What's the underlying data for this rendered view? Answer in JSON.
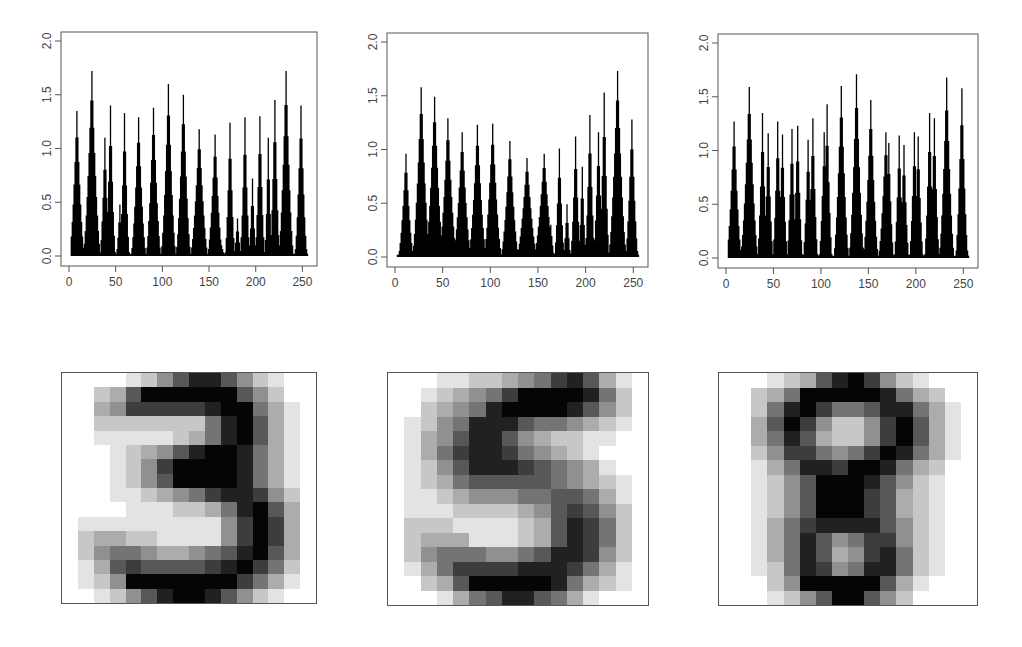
{
  "chart_data": [
    {
      "type": "bar",
      "title": "",
      "xlabel": "",
      "ylabel": "",
      "xlim": [
        0,
        256
      ],
      "ylim": [
        0,
        2.0
      ],
      "x_ticks": [
        0,
        50,
        100,
        150,
        200,
        250
      ],
      "y_ticks": [
        "0.0",
        "0.5",
        "1.0",
        "1.5",
        "2.0"
      ],
      "grid": false,
      "legend": null,
      "note": "256 spike-profile values; peaks listed as [x, height, halfwidth]",
      "peaks": [
        [
          8,
          1.35,
          6
        ],
        [
          24,
          1.72,
          7
        ],
        [
          38,
          1.1,
          4
        ],
        [
          44,
          1.4,
          4
        ],
        [
          54,
          0.48,
          3
        ],
        [
          59,
          1.33,
          4
        ],
        [
          74,
          1.29,
          6
        ],
        [
          90,
          1.38,
          6
        ],
        [
          106,
          1.6,
          6
        ],
        [
          122,
          1.5,
          6
        ],
        [
          139,
          1.18,
          7
        ],
        [
          156,
          1.13,
          6
        ],
        [
          163,
          0.1,
          3
        ],
        [
          172,
          1.24,
          4
        ],
        [
          180,
          0.35,
          3
        ],
        [
          188,
          1.29,
          4
        ],
        [
          196,
          0.72,
          3
        ],
        [
          204,
          1.3,
          4
        ],
        [
          213,
          1.1,
          3
        ],
        [
          220,
          1.45,
          4
        ],
        [
          232,
          1.72,
          6
        ],
        [
          248,
          1.4,
          5
        ]
      ]
    },
    {
      "type": "bar",
      "title": "",
      "xlabel": "",
      "ylabel": "",
      "xlim": [
        0,
        256
      ],
      "ylim": [
        0,
        2.0
      ],
      "x_ticks": [
        0,
        50,
        100,
        150,
        200,
        250
      ],
      "y_ticks": [
        "0.0",
        "0.5",
        "1.0",
        "1.5",
        "2.0"
      ],
      "grid": false,
      "legend": null,
      "note": "256 spike-profile values; peaks listed as [x, height, halfwidth]",
      "peaks": [
        [
          11,
          0.96,
          6
        ],
        [
          27,
          1.58,
          7
        ],
        [
          41,
          1.49,
          7
        ],
        [
          55,
          1.29,
          7
        ],
        [
          70,
          1.16,
          7
        ],
        [
          86,
          1.23,
          7
        ],
        [
          102,
          1.24,
          7
        ],
        [
          120,
          1.08,
          7
        ],
        [
          138,
          0.92,
          8
        ],
        [
          156,
          0.96,
          8
        ],
        [
          163,
          0.3,
          3
        ],
        [
          172,
          1.01,
          4
        ],
        [
          180,
          0.49,
          3
        ],
        [
          189,
          1.12,
          4
        ],
        [
          196,
          0.84,
          3
        ],
        [
          204,
          1.32,
          4
        ],
        [
          213,
          1.16,
          4
        ],
        [
          219,
          1.53,
          4
        ],
        [
          233,
          1.73,
          7
        ],
        [
          248,
          1.28,
          5
        ]
      ]
    },
    {
      "type": "bar",
      "title": "",
      "xlabel": "",
      "ylabel": "",
      "xlim": [
        0,
        256
      ],
      "ylim": [
        0,
        2.0
      ],
      "x_ticks": [
        0,
        50,
        100,
        150,
        200,
        250
      ],
      "y_ticks": [
        "0.0",
        "0.5",
        "1.0",
        "1.5",
        "2.0"
      ],
      "grid": false,
      "legend": null,
      "note": "256 spike-profile values; peaks listed as [x, height, halfwidth]",
      "peaks": [
        [
          8,
          1.27,
          6
        ],
        [
          24,
          1.59,
          7
        ],
        [
          38,
          1.35,
          4
        ],
        [
          44,
          1.16,
          4
        ],
        [
          54,
          1.27,
          4
        ],
        [
          59,
          1.15,
          4
        ],
        [
          69,
          1.2,
          4
        ],
        [
          75,
          1.23,
          4
        ],
        [
          86,
          1.1,
          4
        ],
        [
          91,
          1.3,
          4
        ],
        [
          103,
          1.17,
          4
        ],
        [
          106,
          1.43,
          4
        ],
        [
          121,
          1.6,
          6
        ],
        [
          137,
          1.71,
          6
        ],
        [
          152,
          1.47,
          6
        ],
        [
          168,
          1.17,
          6
        ],
        [
          171,
          1.07,
          4
        ],
        [
          182,
          1.14,
          4
        ],
        [
          187,
          1.05,
          4
        ],
        [
          198,
          1.17,
          4
        ],
        [
          202,
          1.13,
          4
        ],
        [
          214,
          1.35,
          4
        ],
        [
          219,
          1.3,
          4
        ],
        [
          232,
          1.68,
          6
        ],
        [
          248,
          1.58,
          5
        ]
      ]
    }
  ],
  "digits": [
    {
      "label": "3",
      "grid": [
        [
          0,
          0,
          0,
          0,
          1,
          2,
          4,
          6,
          8,
          8,
          6,
          4,
          2,
          1,
          0,
          0
        ],
        [
          0,
          0,
          2,
          3,
          6,
          9,
          9,
          9,
          9,
          9,
          9,
          6,
          4,
          2,
          0,
          0
        ],
        [
          0,
          0,
          3,
          4,
          7,
          7,
          7,
          7,
          7,
          8,
          9,
          9,
          5,
          3,
          1,
          0
        ],
        [
          0,
          0,
          2,
          2,
          2,
          2,
          2,
          2,
          2,
          5,
          8,
          9,
          6,
          3,
          1,
          0
        ],
        [
          0,
          0,
          1,
          1,
          1,
          1,
          1,
          2,
          3,
          5,
          8,
          9,
          6,
          3,
          1,
          0
        ],
        [
          0,
          0,
          0,
          1,
          2,
          3,
          4,
          6,
          8,
          9,
          9,
          8,
          5,
          3,
          1,
          0
        ],
        [
          0,
          0,
          0,
          1,
          2,
          4,
          7,
          9,
          9,
          9,
          9,
          8,
          5,
          3,
          1,
          0
        ],
        [
          0,
          0,
          0,
          1,
          2,
          4,
          6,
          9,
          9,
          9,
          9,
          8,
          5,
          3,
          1,
          0
        ],
        [
          0,
          0,
          0,
          1,
          1,
          2,
          3,
          4,
          5,
          7,
          8,
          8,
          7,
          4,
          2,
          0
        ],
        [
          0,
          0,
          0,
          0,
          1,
          1,
          1,
          2,
          2,
          3,
          5,
          8,
          9,
          6,
          3,
          0
        ],
        [
          0,
          1,
          1,
          1,
          1,
          1,
          1,
          1,
          1,
          1,
          4,
          7,
          9,
          7,
          3,
          0
        ],
        [
          0,
          2,
          3,
          3,
          2,
          2,
          1,
          1,
          1,
          1,
          4,
          7,
          9,
          7,
          3,
          0
        ],
        [
          0,
          2,
          4,
          5,
          5,
          4,
          3,
          3,
          4,
          5,
          6,
          8,
          9,
          6,
          3,
          0
        ],
        [
          0,
          1,
          3,
          6,
          7,
          6,
          6,
          6,
          6,
          7,
          8,
          9,
          7,
          5,
          2,
          0
        ],
        [
          0,
          1,
          2,
          4,
          9,
          9,
          9,
          9,
          9,
          9,
          9,
          7,
          5,
          3,
          1,
          0
        ],
        [
          0,
          0,
          1,
          2,
          4,
          6,
          8,
          9,
          9,
          8,
          6,
          4,
          2,
          1,
          0,
          0
        ]
      ]
    },
    {
      "label": "5",
      "grid": [
        [
          0,
          0,
          0,
          1,
          1,
          2,
          2,
          3,
          4,
          5,
          7,
          8,
          6,
          3,
          1,
          0
        ],
        [
          0,
          0,
          1,
          2,
          3,
          4,
          5,
          7,
          9,
          9,
          9,
          9,
          8,
          5,
          2,
          0
        ],
        [
          0,
          0,
          2,
          3,
          4,
          5,
          8,
          9,
          9,
          9,
          9,
          8,
          6,
          4,
          2,
          0
        ],
        [
          0,
          1,
          2,
          4,
          5,
          8,
          8,
          8,
          6,
          5,
          5,
          4,
          3,
          2,
          1,
          0
        ],
        [
          0,
          1,
          3,
          4,
          6,
          8,
          8,
          6,
          4,
          3,
          2,
          2,
          1,
          1,
          0,
          0
        ],
        [
          0,
          1,
          3,
          5,
          7,
          8,
          8,
          7,
          5,
          4,
          3,
          2,
          1,
          0,
          0,
          0
        ],
        [
          0,
          1,
          2,
          4,
          6,
          8,
          8,
          8,
          7,
          6,
          5,
          4,
          3,
          1,
          0,
          0
        ],
        [
          0,
          1,
          2,
          3,
          5,
          6,
          6,
          6,
          6,
          6,
          5,
          4,
          3,
          2,
          1,
          0
        ],
        [
          0,
          1,
          1,
          2,
          3,
          4,
          4,
          4,
          5,
          5,
          6,
          6,
          5,
          3,
          1,
          0
        ],
        [
          0,
          1,
          1,
          1,
          2,
          2,
          2,
          2,
          3,
          4,
          6,
          7,
          6,
          4,
          2,
          0
        ],
        [
          0,
          2,
          2,
          2,
          1,
          1,
          1,
          1,
          2,
          3,
          6,
          8,
          7,
          5,
          2,
          0
        ],
        [
          0,
          2,
          3,
          3,
          3,
          1,
          1,
          1,
          2,
          3,
          6,
          8,
          7,
          5,
          2,
          0
        ],
        [
          0,
          2,
          4,
          5,
          5,
          5,
          4,
          4,
          5,
          6,
          8,
          8,
          7,
          4,
          2,
          0
        ],
        [
          0,
          1,
          3,
          5,
          7,
          7,
          7,
          7,
          8,
          8,
          8,
          7,
          5,
          3,
          1,
          0
        ],
        [
          0,
          0,
          2,
          3,
          6,
          9,
          9,
          9,
          9,
          9,
          8,
          5,
          3,
          2,
          1,
          0
        ],
        [
          0,
          0,
          0,
          1,
          3,
          5,
          6,
          8,
          8,
          6,
          5,
          3,
          1,
          0,
          0,
          0
        ]
      ]
    },
    {
      "label": "8",
      "grid": [
        [
          0,
          0,
          0,
          1,
          2,
          3,
          6,
          8,
          9,
          7,
          4,
          2,
          1,
          0,
          0,
          0
        ],
        [
          0,
          0,
          2,
          3,
          5,
          9,
          9,
          9,
          9,
          9,
          8,
          5,
          3,
          2,
          0,
          0
        ],
        [
          0,
          0,
          2,
          5,
          8,
          9,
          7,
          5,
          5,
          6,
          8,
          8,
          5,
          3,
          1,
          0
        ],
        [
          0,
          0,
          3,
          6,
          9,
          7,
          4,
          2,
          2,
          4,
          7,
          9,
          6,
          3,
          1,
          0
        ],
        [
          0,
          0,
          3,
          5,
          8,
          6,
          3,
          2,
          2,
          4,
          7,
          9,
          6,
          3,
          1,
          0
        ],
        [
          0,
          0,
          2,
          4,
          7,
          7,
          5,
          4,
          5,
          7,
          9,
          8,
          5,
          3,
          1,
          0
        ],
        [
          0,
          0,
          1,
          3,
          5,
          8,
          8,
          7,
          9,
          9,
          8,
          5,
          3,
          2,
          0,
          0
        ],
        [
          0,
          0,
          1,
          2,
          4,
          6,
          9,
          9,
          9,
          8,
          6,
          4,
          2,
          1,
          0,
          0
        ],
        [
          0,
          0,
          1,
          2,
          4,
          6,
          9,
          9,
          9,
          7,
          6,
          3,
          2,
          1,
          0,
          0
        ],
        [
          0,
          0,
          1,
          2,
          4,
          6,
          9,
          9,
          9,
          7,
          6,
          3,
          2,
          1,
          0,
          0
        ],
        [
          0,
          0,
          1,
          3,
          5,
          7,
          8,
          8,
          8,
          8,
          6,
          4,
          2,
          1,
          0,
          0
        ],
        [
          0,
          0,
          1,
          3,
          5,
          8,
          6,
          4,
          5,
          7,
          7,
          4,
          2,
          1,
          0,
          0
        ],
        [
          0,
          0,
          1,
          3,
          5,
          8,
          6,
          3,
          4,
          7,
          8,
          5,
          2,
          1,
          0,
          0
        ],
        [
          0,
          0,
          1,
          2,
          5,
          8,
          7,
          4,
          5,
          8,
          8,
          5,
          2,
          1,
          0,
          0
        ],
        [
          0,
          0,
          0,
          2,
          4,
          9,
          9,
          9,
          9,
          9,
          6,
          3,
          1,
          0,
          0,
          0
        ],
        [
          0,
          0,
          0,
          1,
          2,
          4,
          6,
          9,
          9,
          6,
          4,
          2,
          0,
          0,
          0,
          0
        ]
      ]
    }
  ],
  "layout": {
    "charts": [
      {
        "box": [
          61,
          32,
          256,
          234
        ]
      },
      {
        "box": [
          387,
          33,
          261,
          234
        ]
      },
      {
        "box": [
          718,
          34,
          260,
          234
        ]
      }
    ],
    "digit_boxes": [
      [
        61,
        372,
        256,
        232
      ],
      [
        387,
        372,
        262,
        234
      ],
      [
        718,
        372,
        260,
        234
      ]
    ]
  }
}
